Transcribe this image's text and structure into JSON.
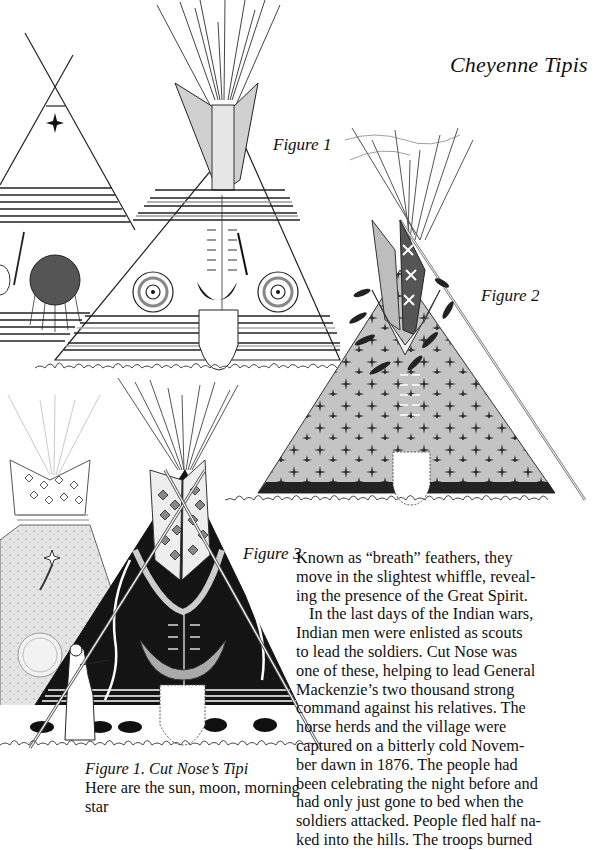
{
  "page": {
    "title": "Cheyenne Tipis"
  },
  "figures": [
    {
      "label": "Figure 1",
      "subject": "Cut Nose's Tipi",
      "motifs": [
        "morning-star",
        "sun-disc",
        "target-circles",
        "crescent-moon",
        "horizontal-stripes",
        "smoke-flaps",
        "lodge-poles"
      ]
    },
    {
      "label": "Figure 2",
      "subject": "star-covered tipi",
      "motifs": [
        "cross-stars",
        "star-smoke-flaps",
        "feather-tassels",
        "dark-base-band",
        "lodge-poles"
      ]
    },
    {
      "label": "Figure 3",
      "subject": "black tipi with buffalo border",
      "motifs": [
        "diamond-stars",
        "crescent-moon",
        "buffalo-frieze",
        "woman-with-pole",
        "background-tipi"
      ]
    }
  ],
  "caption": {
    "title": "Figure 1. Cut Nose’s Tipi",
    "text": "Here are the sun, moon, morning star"
  },
  "body_text": {
    "paragraphs": [
      {
        "indent": false,
        "lines": [
          "Known as “breath” feathers, they",
          "move in the slightest whiffle, reveal-",
          "ing the presence of the Great Spirit."
        ]
      },
      {
        "indent": true,
        "lines": [
          "In the last days of the Indian wars,",
          "Indian men were enlisted as scouts",
          "to lead the soldiers. Cut Nose was",
          "one of these, helping to lead General",
          "Mackenzie’s two thousand strong",
          "command against his relatives. The",
          "horse herds and the village were",
          "captured on a bitterly cold Novem-",
          "ber dawn in 1876. The people had",
          "been celebrating the night before and",
          "had only just gone to bed when the",
          "soldiers attacked. People fled half na-",
          "ked into the hills. The troops burned"
        ]
      }
    ]
  },
  "colors": {
    "ink": "#111111",
    "gray_fill": "#bdbdbd",
    "light_gray": "#d9d9d9",
    "dark_fill": "#1a1a1a",
    "paper": "#ffffff"
  }
}
